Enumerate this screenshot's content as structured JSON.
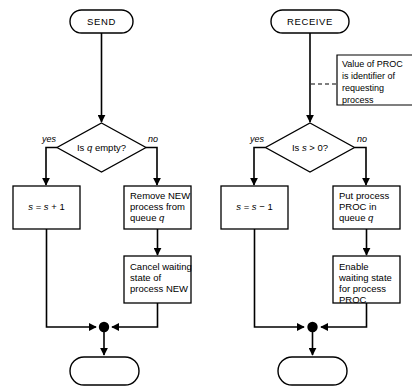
{
  "diagram": {
    "background_color": "#ffffff",
    "line_color": "#000000"
  },
  "left_flow": {
    "start_terminal": {
      "label": "SEND"
    },
    "decision": {
      "label_prefix": "Is ",
      "label_var": "q",
      "label_suffix": " empty?",
      "full": "Is q empty?"
    },
    "branch_yes": {
      "label": "yes"
    },
    "branch_no": {
      "label": "no"
    },
    "yes_box": {
      "line1": "s = s + 1"
    },
    "no_box_1": {
      "line1": "Remove NEW",
      "line2": "process from",
      "line3": "queue q"
    },
    "no_box_2": {
      "line1": "Cancel waiting",
      "line2": "state of",
      "line3": "process NEW"
    },
    "end_terminal": {
      "label": ""
    }
  },
  "right_flow": {
    "start_terminal": {
      "label": "RECEIVE"
    },
    "annotation": {
      "line1": "Value of PROC",
      "line2": "is identifier of",
      "line3": "requesting",
      "line4": "process"
    },
    "decision": {
      "label_prefix": "Is ",
      "label_var": "s",
      "label_suffix": " > 0?",
      "full": "Is s > 0?"
    },
    "branch_yes": {
      "label": "yes"
    },
    "branch_no": {
      "label": "no"
    },
    "yes_box": {
      "line1": "s = s - 1"
    },
    "no_box_1": {
      "line1": "Put process",
      "line2": "PROC in",
      "line3": "queue q"
    },
    "no_box_2": {
      "line1": "Enable",
      "line2": "waiting state",
      "line3": "for process",
      "line4": "PROC"
    },
    "end_terminal": {
      "label": ""
    }
  }
}
